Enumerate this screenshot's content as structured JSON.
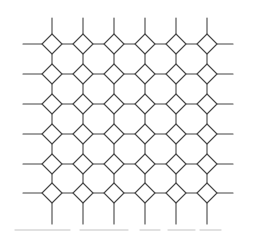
{
  "figure": {
    "name": "truncated-square-tiling",
    "canvas": {
      "width": 255,
      "height": 234,
      "background": "#ffffff"
    },
    "style": {
      "stroke": "#454545",
      "stroke_width": 1.1
    },
    "grid": {
      "columns": 6,
      "rows": 6,
      "column_centers": [
        52,
        83,
        114,
        145,
        176,
        207
      ],
      "row_centers": [
        44,
        74,
        104,
        134,
        164,
        193
      ],
      "diamond_half_diagonal": 10
    },
    "edge_extensions": {
      "top_y": 18,
      "bottom_y": 224,
      "left_x": 23,
      "right_x": 233
    },
    "scan_artifact": {
      "y": 230,
      "color": "#d8d8d8",
      "stroke_width": 1.3,
      "segments": [
        [
          15,
          70
        ],
        [
          80,
          128
        ],
        [
          140,
          160
        ],
        [
          168,
          195
        ],
        [
          200,
          221
        ]
      ]
    }
  }
}
